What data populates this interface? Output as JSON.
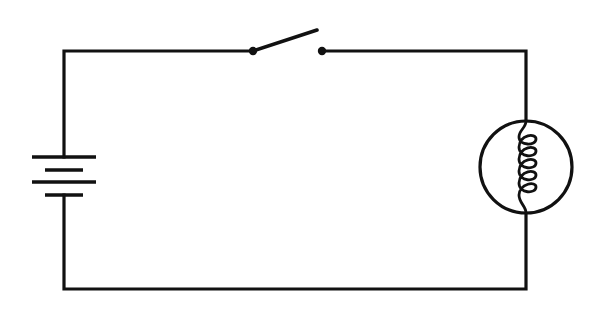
{
  "diagram": {
    "title": "Simple series circuit",
    "components": [
      {
        "id": "battery",
        "type": "battery",
        "label": "Battery (two cells)"
      },
      {
        "id": "switch",
        "type": "switch",
        "state": "open",
        "label": "Open switch"
      },
      {
        "id": "lamp",
        "type": "lamp",
        "label": "Light bulb"
      }
    ],
    "connections": [
      [
        "battery",
        "switch"
      ],
      [
        "switch",
        "lamp"
      ],
      [
        "lamp",
        "battery"
      ]
    ],
    "colors": {
      "stroke": "#111111",
      "background": "#ffffff"
    }
  }
}
